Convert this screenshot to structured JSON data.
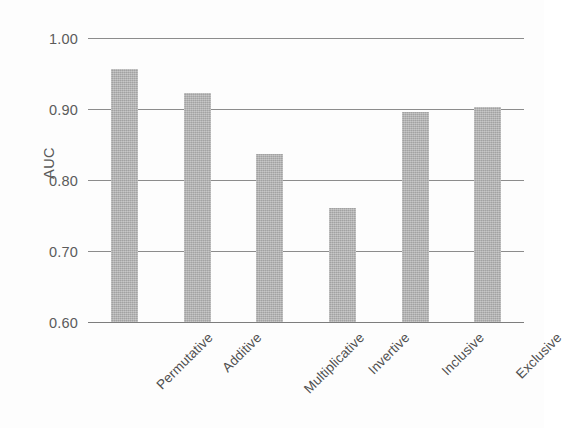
{
  "chart_data": {
    "type": "bar",
    "title": "",
    "subtitle": "",
    "xlabel": "",
    "ylabel": "AUC",
    "categories": [
      "Permutative",
      "Additive",
      "Multiplicative",
      "Invertive",
      "Inclusive",
      "Exclusive"
    ],
    "values": [
      0.957,
      0.922,
      0.837,
      0.76,
      0.896,
      0.903
    ],
    "ylim": [
      0.6,
      1.0
    ],
    "yticks": [
      0.6,
      0.7,
      0.8,
      0.9,
      1.0
    ],
    "ytick_labels": [
      "0.60",
      "0.70",
      "0.80",
      "0.90",
      "1.00"
    ],
    "grid": true,
    "grid_axis": "y",
    "legend": false,
    "legend_position": "none",
    "series": [
      {
        "name": "AUC",
        "values": [
          0.957,
          0.922,
          0.837,
          0.76,
          0.896,
          0.903
        ]
      }
    ],
    "bar_color": "#b2b2b2",
    "gridline_color": "#8c8c8c",
    "text_color": "#4f4f4f",
    "background_color": "#fdfdfd",
    "xtick_rotation": -45
  }
}
